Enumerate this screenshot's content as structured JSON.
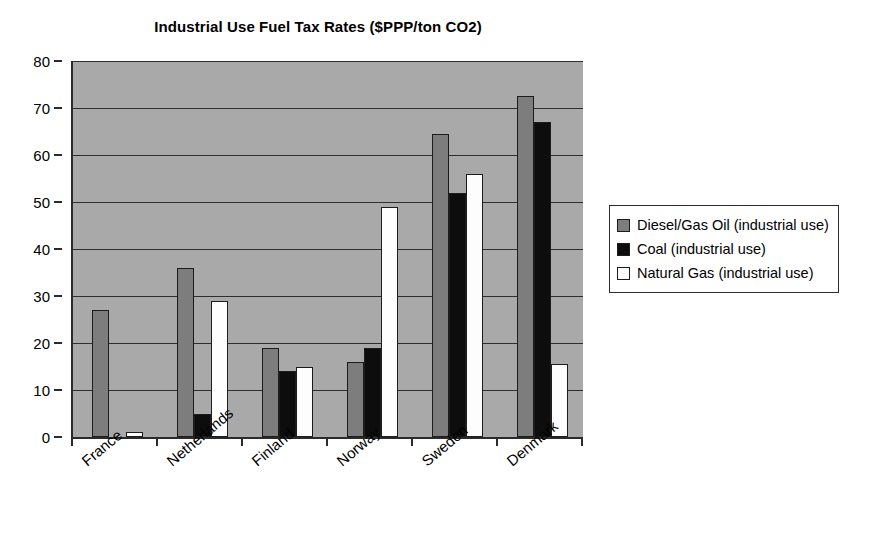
{
  "chart_data": {
    "type": "bar",
    "title": "Industrial Use Fuel Tax Rates ($PPP/ton CO2)",
    "xlabel": "",
    "ylabel": "",
    "ylim": [
      0,
      80
    ],
    "ytick_step": 10,
    "yticks": [
      "0",
      "10",
      "20",
      "30",
      "40",
      "50",
      "60",
      "70",
      "80"
    ],
    "grid": true,
    "legend_position": "right",
    "categories": [
      "France",
      "Netherlands",
      "Finland",
      "Norway",
      "Sweden",
      "Denmark"
    ],
    "series": [
      {
        "name": "Diesel/Gas Oil (industrial use)",
        "color": "#7d7d7d",
        "swatch": "gray-swatch",
        "values": [
          27,
          36,
          19,
          16,
          64.5,
          72.5
        ]
      },
      {
        "name": "Coal (industrial use)",
        "color": "#0d0d0d",
        "swatch": "black-swatch",
        "values": [
          0,
          5,
          14,
          19,
          52,
          67
        ]
      },
      {
        "name": "Natural Gas (industrial use)",
        "color": "#fdfdfd",
        "swatch": "white-swatch",
        "values": [
          1,
          29,
          15,
          49,
          56,
          15.5
        ]
      }
    ],
    "plot_background": "#a9a9a9",
    "axis_color": "#2b2b2b"
  }
}
